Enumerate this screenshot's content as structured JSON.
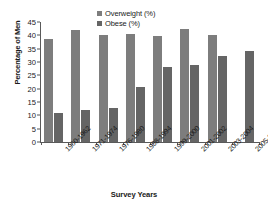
{
  "chart_data": {
    "type": "bar",
    "title": "",
    "xlabel": "Survey Years",
    "ylabel": "Percentage of Men",
    "ylim": [
      0,
      45
    ],
    "ytick_step": 5,
    "yticks": [
      0,
      5,
      10,
      15,
      20,
      25,
      30,
      35,
      40,
      45
    ],
    "grid": false,
    "legend_position": "top-center",
    "categories": [
      "1960-1962",
      "1971-1974",
      "1976-1980",
      "1988-1994",
      "1999-2000",
      "2001-2002",
      "2003-2004",
      "2005-2006*"
    ],
    "series": [
      {
        "name": "Overweight (%)",
        "color": "#7d7d7d",
        "values": [
          38.7,
          41.9,
          40.1,
          40.6,
          39.6,
          42.2,
          40.1,
          null
        ]
      },
      {
        "name": "Obese (%)",
        "color": "#656565",
        "values": [
          10.7,
          12.1,
          12.8,
          20.7,
          28.2,
          29.0,
          32.3,
          34.3
        ]
      }
    ]
  },
  "legend": {
    "items": [
      {
        "label": "Overweight (%)",
        "swatch": "#7d7d7d"
      },
      {
        "label": "Obese (%)",
        "swatch": "#656565"
      }
    ]
  },
  "axes": {
    "y_title": "Percentage of Men",
    "x_title": "Survey Years"
  }
}
